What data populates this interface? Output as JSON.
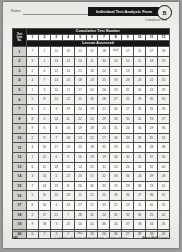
{
  "document": {
    "title": "Individual Test Analysis Form",
    "badge_letter": "B",
    "subtitle": "Cumulative Test",
    "name_label": "Name",
    "name_value": ""
  },
  "table": {
    "band_top": "Cumulative Test Number",
    "band_mid": "Lesson Assessed",
    "corner_label": "Test Item No.",
    "corner_lines": [
      "Test",
      "Item",
      "No."
    ],
    "columns": [
      "1",
      "2",
      "3",
      "4",
      "5",
      "6",
      "7",
      "8",
      "9",
      "10",
      "11",
      "12"
    ],
    "rows": [
      {
        "no": "1",
        "cells": [
          "7",
          "1",
          "11",
          "15",
          "12",
          "15",
          "18",
          "Inv.2",
          "17",
          "11",
          "27",
          "18"
        ]
      },
      {
        "no": "2",
        "cells": [
          "3",
          "1",
          "13",
          "13",
          "20",
          "11",
          "30",
          "14",
          "10",
          "11",
          "18",
          "19"
        ]
      },
      {
        "no": "3",
        "cells": [
          "2",
          "4",
          "12",
          "14",
          "21",
          "16",
          "24",
          "21",
          "13",
          "26",
          "21",
          "22"
        ]
      },
      {
        "no": "4",
        "cells": [
          "4",
          "7",
          "14",
          "10",
          "18",
          "23",
          "25",
          "19",
          "28",
          "23",
          "22",
          "25"
        ]
      },
      {
        "no": "5",
        "cells": [
          "1",
          "3",
          "10",
          "17",
          "17",
          "20",
          "26",
          "23",
          "31",
          "20",
          "24",
          "29"
        ]
      },
      {
        "no": "6",
        "cells": [
          "5",
          "8",
          "15",
          "12",
          "15",
          "26",
          "28",
          "27",
          "22",
          "29",
          "30",
          "30"
        ]
      },
      {
        "no": "7",
        "cells": [
          "6",
          "2",
          "9",
          "19",
          "24",
          "19",
          "21",
          "30",
          "27",
          "32",
          "26",
          "33"
        ]
      },
      {
        "no": "8",
        "cells": [
          "8",
          "5",
          "16",
          "11",
          "22",
          "24",
          "29",
          "18",
          "35",
          "25",
          "33",
          "27"
        ]
      },
      {
        "no": "9",
        "cells": [
          "9",
          "6",
          "8",
          "16",
          "19",
          "28",
          "23",
          "31",
          "24",
          "34",
          "29",
          "36"
        ]
      },
      {
        "no": "10",
        "cells": [
          "2",
          "9",
          "7",
          "18",
          "13",
          "22",
          "27",
          "26",
          "33",
          "28",
          "35",
          "31"
        ]
      },
      {
        "no": "11",
        "cells": [
          "4",
          "10",
          "17",
          "20",
          "25",
          "18",
          "32",
          "29",
          "21",
          "36",
          "28",
          "38"
        ]
      },
      {
        "no": "12",
        "cells": [
          "1",
          "12",
          "6",
          "9",
          "16",
          "29",
          "19",
          "34",
          "30",
          "22",
          "37",
          "34"
        ]
      },
      {
        "no": "13",
        "cells": [
          "6",
          "11",
          "18",
          "21",
          "14",
          "25",
          "31",
          "20",
          "26",
          "35",
          "32",
          "40"
        ]
      },
      {
        "no": "14",
        "cells": [
          "3",
          "13",
          "5",
          "22",
          "23",
          "17",
          "22",
          "33",
          "36",
          "24",
          "39",
          "28"
        ]
      },
      {
        "no": "15",
        "cells": [
          "7",
          "14",
          "19",
          "8",
          "26",
          "30",
          "35",
          "25",
          "29",
          "38",
          "23",
          "41"
        ]
      },
      {
        "no": "16",
        "cells": [
          "5",
          "15",
          "20",
          "23",
          "11",
          "21",
          "20",
          "28",
          "34",
          "27",
          "36",
          "32"
        ]
      },
      {
        "no": "17",
        "cells": [
          "8",
          "16",
          "4",
          "24",
          "27",
          "27",
          "33",
          "22",
          "23",
          "31",
          "40",
          "35"
        ]
      },
      {
        "no": "18",
        "cells": [
          "2",
          "17",
          "21",
          "7",
          "28",
          "31",
          "24",
          "35",
          "32",
          "30",
          "25",
          "42"
        ]
      },
      {
        "no": "19",
        "cells": [
          "9",
          "18",
          "3",
          "25",
          "10",
          "20",
          "36",
          "24",
          "37",
          "33",
          "34",
          "26"
        ]
      },
      {
        "no": "20",
        "cells": [
          "6",
          "7",
          "2",
          "7",
          "Inv.2",
          "33",
          "26",
          "36",
          "27",
          "39",
          "38",
          "43"
        ]
      }
    ]
  },
  "footer": {
    "page_number": "146",
    "center_note": "© Harcourt Achieve Inc. and Stephen Hake. All rights reserved.",
    "right_brand": "Saxon Math",
    "right_course": "Course 1"
  }
}
